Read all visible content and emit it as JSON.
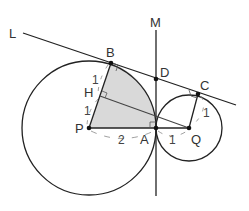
{
  "points": {
    "L": "L",
    "M": "M",
    "B": "B",
    "D": "D",
    "C": "C",
    "H": "H",
    "P": "P",
    "A": "A",
    "Q": "Q"
  },
  "lengths": {
    "PA": "2",
    "AQ": "1",
    "BH": "1",
    "HP": "1",
    "QC": "1"
  },
  "colors": {
    "stroke": "#222222",
    "shade": "#d9d9d9",
    "dim": "#888888"
  }
}
